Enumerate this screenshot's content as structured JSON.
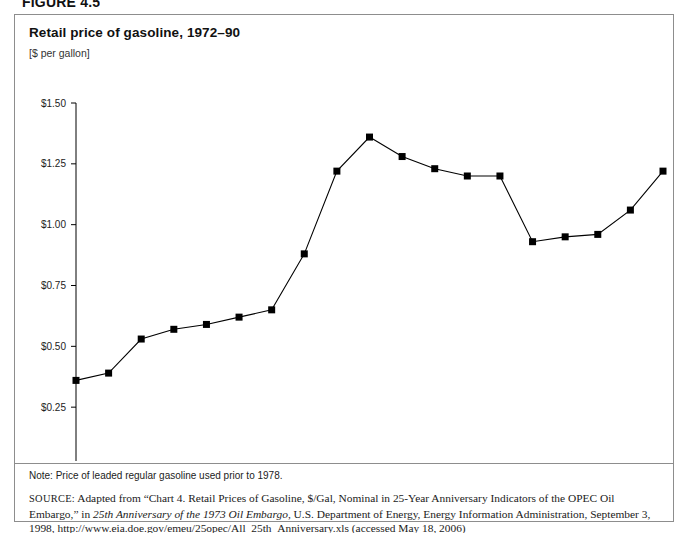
{
  "figure": {
    "heading": "FIGURE 4.5"
  },
  "chart_panel": {
    "title": "Retail price of gasoline, 1972–90",
    "units": "[$ per gallon]",
    "note": "Note: Price of leaded regular gasoline used prior to 1978.",
    "source_label": "SOURCE:",
    "source_part1": " Adapted from “Chart 4. Retail Prices of Gasoline, $/Gal, Nominal in 25-Year Anniversary Indicators of the OPEC Oil Embargo,” in ",
    "source_italic1": "25th Anniversary of the 1973 Oil Embargo",
    "source_part2": ", U.S. Department of Energy, Energy Information Administration, September 3, 1998, http://www.eia.doe.gov/emeu/25opec/All_25th_Anniversary.xls (accessed May 18, 2006)"
  },
  "chart_data": {
    "type": "line",
    "title": "Retail price of gasoline, 1972–90",
    "subtitle": "[$ per gallon]",
    "xlabel": "",
    "ylabel": "[$ per gallon]",
    "ylim": [
      0,
      1.5
    ],
    "ytick_values": [
      0,
      0.25,
      0.5,
      0.75,
      1.0,
      1.25,
      1.5
    ],
    "ytick_labels": [
      "$0.00",
      "$0.25",
      "$0.50",
      "$0.75",
      "$1.00",
      "$1.25",
      "$1.50"
    ],
    "grid": false,
    "legend": null,
    "marker": "square",
    "marker_color": "#000000",
    "line_color": "#000000",
    "categories": [
      1972,
      1973,
      1974,
      1975,
      1976,
      1977,
      1978,
      1979,
      1980,
      1981,
      1982,
      1983,
      1984,
      1985,
      1986,
      1987,
      1988,
      1989,
      1990
    ],
    "tick_labels": [
      "1972",
      "1973",
      "1974",
      "1975",
      "1976",
      "1977",
      "1978",
      "1979",
      "1980",
      "1981",
      "1982",
      "1983",
      "1984",
      "1985",
      "1986",
      "1987",
      "1988",
      "1989",
      "1990"
    ],
    "values": [
      0.36,
      0.39,
      0.53,
      0.57,
      0.59,
      0.62,
      0.65,
      0.88,
      1.22,
      1.36,
      1.28,
      1.23,
      1.2,
      1.2,
      0.93,
      0.95,
      0.96,
      1.06,
      1.22
    ],
    "series": [
      {
        "name": "Retail price of gasoline ($ per gallon)",
        "values": [
          0.36,
          0.39,
          0.53,
          0.57,
          0.59,
          0.62,
          0.65,
          0.88,
          1.22,
          1.36,
          1.28,
          1.23,
          1.2,
          1.2,
          0.93,
          0.95,
          0.96,
          1.06,
          1.22
        ]
      }
    ],
    "annotations": [
      "Price of leaded regular gasoline used prior to 1978."
    ]
  }
}
